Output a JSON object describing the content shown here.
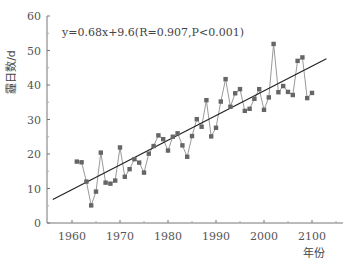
{
  "chart_data": {
    "type": "line",
    "title": "",
    "annotation": "y=0.68x+9.6(R=0.907,P<0.001)",
    "xlabel": "年份",
    "ylabel": "霾日数/d",
    "xlim": [
      1955,
      2015
    ],
    "ylim": [
      0,
      60
    ],
    "x_ticks": [
      1960,
      1970,
      1980,
      1990,
      2000,
      2010
    ],
    "x_tick_labels": [
      "1960",
      "1970",
      "1980",
      "1990",
      "2000",
      "2100"
    ],
    "y_ticks": [
      0,
      10,
      20,
      30,
      40,
      50,
      60
    ],
    "y_tick_labels": [
      "0",
      "10",
      "20",
      "30",
      "40",
      "50",
      "60"
    ],
    "grid": false,
    "legend": null,
    "series": [
      {
        "name": "霾日数",
        "style": "line+square-markers",
        "color": "#666666",
        "x": [
          1961,
          1962,
          1963,
          1964,
          1965,
          1966,
          1967,
          1968,
          1969,
          1970,
          1971,
          1972,
          1973,
          1974,
          1975,
          1976,
          1977,
          1978,
          1979,
          1980,
          1981,
          1982,
          1983,
          1984,
          1985,
          1986,
          1987,
          1988,
          1989,
          1990,
          1991,
          1992,
          1993,
          1994,
          1995,
          1996,
          1997,
          1998,
          1999,
          2000,
          2001,
          2002,
          2003,
          2004,
          2005,
          2006,
          2007,
          2008,
          2009,
          2010
        ],
        "values": [
          17.8,
          17.6,
          12.0,
          5.1,
          9.1,
          20.4,
          11.7,
          11.4,
          12.3,
          21.9,
          13.4,
          15.6,
          18.5,
          17.5,
          14.6,
          20.1,
          22.3,
          25.4,
          24.3,
          21.0,
          25.0,
          26.0,
          22.5,
          19.2,
          25.2,
          30.1,
          27.9,
          35.6,
          25.1,
          27.6,
          35.2,
          41.7,
          33.7,
          37.6,
          38.8,
          32.5,
          33.1,
          36.0,
          38.8,
          32.8,
          36.4,
          51.9,
          37.9,
          39.7,
          38.0,
          37.1,
          47.0,
          48.0,
          36.2,
          37.7
        ]
      },
      {
        "name": "linear trend",
        "style": "line",
        "color": "#222222",
        "x": [
          1956,
          2013
        ],
        "values": [
          6.8,
          47.6
        ]
      }
    ]
  }
}
